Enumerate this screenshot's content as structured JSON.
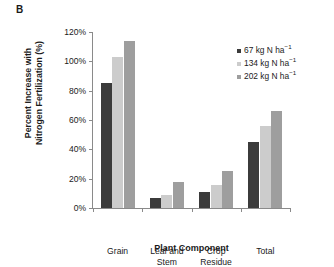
{
  "panel_label": "B",
  "colors": {
    "series_1": "#3b3b3b",
    "series_2": "#cccccc",
    "series_3": "#9e9e9e",
    "axis": "#8a8a8a",
    "text": "#1a1a1a",
    "background": "#ffffff"
  },
  "legend": {
    "position": "top-right",
    "entries": [
      {
        "label_value": "67",
        "label_unit": "kg N ha",
        "label_exp": "−1",
        "color": "#3b3b3b"
      },
      {
        "label_value": "134",
        "label_unit": "kg N ha",
        "label_exp": "−1",
        "color": "#cccccc"
      },
      {
        "label_value": "202",
        "label_unit": "kg N ha",
        "label_exp": "−1",
        "color": "#9e9e9e"
      }
    ]
  },
  "axes": {
    "y_title_line1": "Percent Increase with",
    "y_title_line2": "Nitrogen Fertilization (%)",
    "x_title": "Plant Component",
    "y_ticks": [
      "0%",
      "20%",
      "40%",
      "60%",
      "80%",
      "100%",
      "120%"
    ]
  },
  "chart_data": {
    "type": "bar",
    "title": "",
    "subtitle": "",
    "panel": "B",
    "categories": [
      "Grain",
      "Leaf and\nStem",
      "Crop\nResidue",
      "Total"
    ],
    "series": [
      {
        "name": "67 kg N ha−1",
        "color": "#3b3b3b",
        "values": [
          85,
          7,
          11,
          45
        ]
      },
      {
        "name": "134 kg N ha−1",
        "color": "#cccccc",
        "values": [
          103,
          9,
          16,
          56
        ]
      },
      {
        "name": "202 kg N ha−1",
        "color": "#9e9e9e",
        "values": [
          114,
          18,
          25,
          66
        ]
      }
    ],
    "xlabel": "Plant Component",
    "ylabel": "Percent Increase with Nitrogen Fertilization (%)",
    "ylim": [
      0,
      120
    ],
    "ytick_step": 20,
    "grid": false,
    "legend_position": "top-right"
  }
}
